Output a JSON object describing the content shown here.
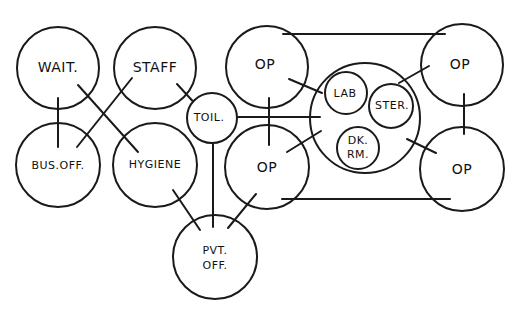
{
  "diagram": {
    "type": "bubble-adjacency-diagram",
    "stroke_color": "#1a1a1a",
    "background": "#ffffff",
    "nodes": [
      {
        "id": "wait",
        "label": "WAIT.",
        "cx": 58,
        "cy": 68,
        "r": 41
      },
      {
        "id": "staff",
        "label": "STAFF",
        "cx": 155,
        "cy": 68,
        "r": 41
      },
      {
        "id": "bus_off",
        "label": "BUS.OFF.",
        "cx": 58,
        "cy": 165,
        "r": 42
      },
      {
        "id": "hygiene",
        "label": "HYGIENE",
        "cx": 155,
        "cy": 165,
        "r": 42
      },
      {
        "id": "toil",
        "label": "TOIL.",
        "cx": 212,
        "cy": 118,
        "r": 25
      },
      {
        "id": "pvt_off",
        "label_line1": "PVT.",
        "label_line2": "OFF.",
        "cx": 215,
        "cy": 257,
        "r": 42
      },
      {
        "id": "op_tl",
        "label": "OP",
        "cx": 267,
        "cy": 67,
        "r": 41
      },
      {
        "id": "op_bl",
        "label": "OP",
        "cx": 267,
        "cy": 167,
        "r": 42
      },
      {
        "id": "core",
        "label": "",
        "cx": 365,
        "cy": 118,
        "r": 55
      },
      {
        "id": "lab",
        "label": "LAB",
        "cx": 346,
        "cy": 93,
        "r": 21
      },
      {
        "id": "ster",
        "label": "STER.",
        "cx": 391,
        "cy": 106,
        "r": 22
      },
      {
        "id": "dk_rm",
        "label_line1": "DK.",
        "label_line2": "RM.",
        "cx": 358,
        "cy": 148,
        "r": 21
      },
      {
        "id": "op_tr",
        "label": "OP",
        "cx": 462,
        "cy": 65,
        "r": 41
      },
      {
        "id": "op_br",
        "label": "OP",
        "cx": 462,
        "cy": 169,
        "r": 42
      }
    ],
    "edges": [
      {
        "from": "wait",
        "to": "bus_off"
      },
      {
        "from": "wait",
        "to": "hygiene"
      },
      {
        "from": "staff",
        "to": "bus_off"
      },
      {
        "from": "staff",
        "to": "toil"
      },
      {
        "from": "toil",
        "to": "core"
      },
      {
        "from": "toil",
        "to": "pvt_off"
      },
      {
        "from": "hygiene",
        "to": "pvt_off"
      },
      {
        "from": "op_bl",
        "to": "pvt_off"
      },
      {
        "from": "op_tl",
        "to": "op_bl"
      },
      {
        "from": "op_tl",
        "to": "core"
      },
      {
        "from": "op_bl",
        "to": "core"
      },
      {
        "from": "op_tr",
        "to": "core"
      },
      {
        "from": "op_br",
        "to": "core"
      },
      {
        "from": "op_tr",
        "to": "op_br"
      },
      {
        "from": "op_tl",
        "to": "op_tr"
      },
      {
        "from": "op_bl",
        "to": "op_br"
      }
    ]
  }
}
